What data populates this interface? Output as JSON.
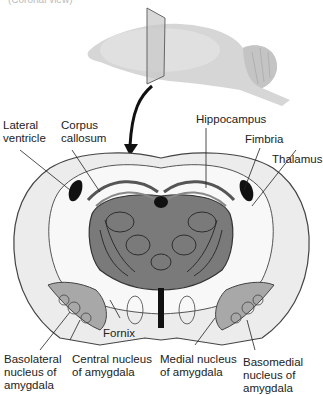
{
  "caption_top": "(Coronal view)",
  "colors": {
    "outer_tissue": "#e8e8e8",
    "white_matter": "#f7f7f7",
    "thalamus_fill": "#7a7a7a",
    "thalamus_dark": "#5f5f5f",
    "amygdala_fill": "#a8a8a8",
    "ventricle": "#111111",
    "outline": "#444444",
    "plane": "#cfcfcf",
    "brain_3d": "#d9d9d9"
  },
  "labels": {
    "lateral_ventricle": "Lateral\nventricle",
    "corpus_callosum": "Corpus\ncallosum",
    "hippocampus": "Hippocampus",
    "fimbria": "Fimbria",
    "thalamus": "Thalamus",
    "fornix": "Fornix",
    "basolateral": "Basolateral\nnucleus of\namygdala",
    "central": "Central nucleus\nof amygdala",
    "medial": "Medial nucleus\nof amygdala",
    "basomedial": "Basomedial\nnucleus of\namygdala"
  }
}
